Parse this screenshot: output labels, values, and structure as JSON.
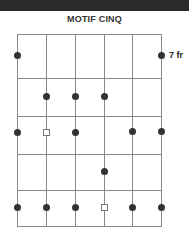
{
  "diagram": {
    "title": "MOTIF CINQ",
    "fret_label": "7 fr",
    "colors": {
      "header_bar": "#2a2a2a",
      "grid": "#888888",
      "dot": "#333333"
    },
    "strings_x": [
      17,
      46,
      75,
      104,
      132,
      161
    ],
    "frets_y": [
      34,
      78,
      116,
      154,
      190,
      226
    ],
    "notes": [
      {
        "string": 1,
        "y": 55,
        "type": "dot"
      },
      {
        "string": 6,
        "y": 55,
        "type": "dot"
      },
      {
        "string": 2,
        "y": 96,
        "type": "dot"
      },
      {
        "string": 3,
        "y": 96,
        "type": "dot"
      },
      {
        "string": 4,
        "y": 96,
        "type": "dot"
      },
      {
        "string": 1,
        "y": 132,
        "type": "dot"
      },
      {
        "string": 2,
        "y": 132,
        "type": "root-square"
      },
      {
        "string": 3,
        "y": 132,
        "type": "dot"
      },
      {
        "string": 5,
        "y": 131,
        "type": "dot"
      },
      {
        "string": 6,
        "y": 131,
        "type": "dot"
      },
      {
        "string": 4,
        "y": 171,
        "type": "dot"
      },
      {
        "string": 1,
        "y": 207,
        "type": "dot"
      },
      {
        "string": 2,
        "y": 207,
        "type": "dot"
      },
      {
        "string": 3,
        "y": 207,
        "type": "dot"
      },
      {
        "string": 4,
        "y": 207,
        "type": "root-square"
      },
      {
        "string": 5,
        "y": 207,
        "type": "dot"
      },
      {
        "string": 6,
        "y": 207,
        "type": "dot"
      }
    ]
  }
}
